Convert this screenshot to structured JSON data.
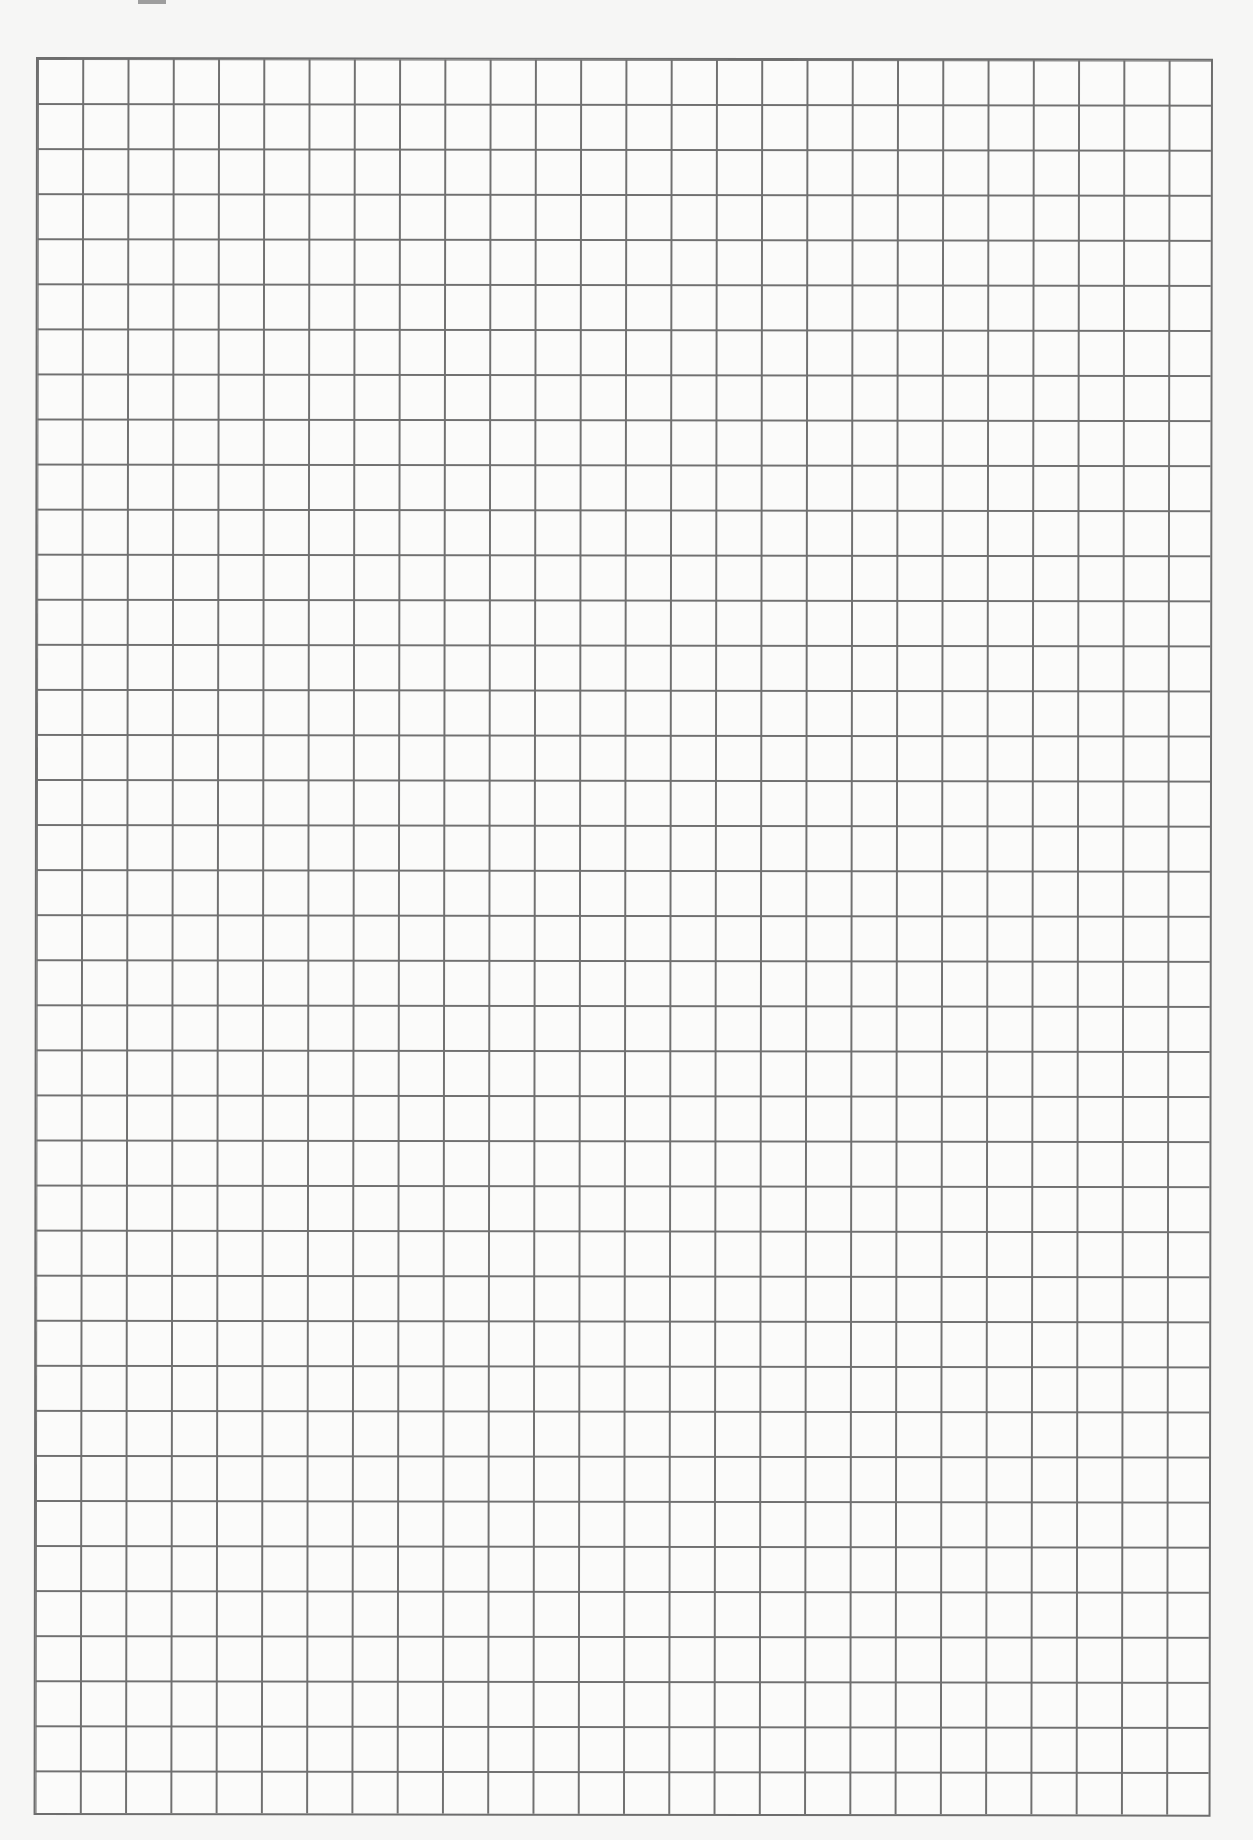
{
  "document": {
    "type": "graph-paper",
    "grid": {
      "columns": 26,
      "rows": 39,
      "line_color": "#707070",
      "paper_color": "#f6f6f5"
    }
  }
}
